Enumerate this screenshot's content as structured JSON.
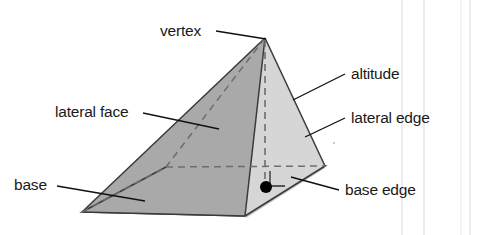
{
  "figure": {
    "background_color": "#ffffff",
    "labels": {
      "vertex": "vertex",
      "altitude": "altitude",
      "lateral_face": "lateral face",
      "lateral_edge": "lateral edge",
      "base": "base",
      "base_edge": "base edge"
    },
    "colors": {
      "left_lateral_face": "#a9a9a9",
      "right_lateral_face": "#d6d6d6",
      "base_face": "#b0b0b0",
      "edge_stroke": "#3a3a3a",
      "hidden_edge_stroke": "#6d6d6d",
      "text": "#1a1a1a",
      "foot_dot": "#000000",
      "scan_line": "#d9d9d9"
    },
    "geometry": {
      "apex": [
        265,
        38
      ],
      "base_left": [
        82,
        212
      ],
      "base_front": [
        245,
        216
      ],
      "base_right": [
        325,
        166
      ],
      "base_back_hidden": [
        166,
        167
      ],
      "altitude_foot": [
        265,
        186
      ],
      "right_angle_marker": [
        270,
        172,
        16,
        15
      ],
      "foot_dot_center": [
        266,
        187
      ],
      "foot_dot_radius": 6
    },
    "scan_lines_x": [
      402,
      424,
      461,
      470
    ]
  }
}
